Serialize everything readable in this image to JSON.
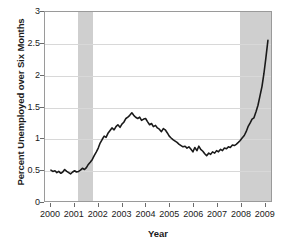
{
  "chart_data": {
    "type": "line",
    "title": "",
    "xlabel": "Year",
    "ylabel": "Percent Unemployed over Six Months",
    "xlim": [
      1999.75,
      2009.3
    ],
    "ylim": [
      0,
      3
    ],
    "grid": true,
    "legend": null,
    "line_color": "#1a1a1a",
    "shading_color": "#cfcfcf",
    "gridline_color": "#d8d8d8",
    "frame_color": "#9a9a9a",
    "yticks": [
      0,
      0.5,
      1,
      1.5,
      2,
      2.5,
      3
    ],
    "ytick_labels": [
      "0",
      "0.5",
      "1",
      "1.5",
      "2",
      "2.5",
      "3"
    ],
    "xticks": [
      2000,
      2001,
      2002,
      2003,
      2004,
      2005,
      2006,
      2007,
      2008,
      2009
    ],
    "xtick_labels": [
      "2000",
      "2001",
      "2002",
      "2003",
      "2004",
      "2005",
      "2006",
      "2007",
      "2008",
      "2009"
    ],
    "shaded_regions": [
      {
        "name": "recession-2001",
        "x0": 2001.15,
        "x1": 2001.75
      },
      {
        "name": "recession-2008",
        "x0": 2007.9,
        "x1": 2009.35
      }
    ],
    "series": [
      {
        "name": "Percent unemployed over six months",
        "x": [
          2000.0,
          2000.08,
          2000.17,
          2000.25,
          2000.33,
          2000.42,
          2000.5,
          2000.58,
          2000.67,
          2000.75,
          2000.83,
          2000.92,
          2001.0,
          2001.08,
          2001.17,
          2001.25,
          2001.33,
          2001.42,
          2001.5,
          2001.58,
          2001.67,
          2001.75,
          2001.83,
          2001.92,
          2002.0,
          2002.08,
          2002.17,
          2002.25,
          2002.33,
          2002.42,
          2002.5,
          2002.58,
          2002.67,
          2002.75,
          2002.83,
          2002.92,
          2003.0,
          2003.08,
          2003.17,
          2003.25,
          2003.33,
          2003.42,
          2003.5,
          2003.58,
          2003.67,
          2003.75,
          2003.83,
          2003.92,
          2004.0,
          2004.08,
          2004.17,
          2004.25,
          2004.33,
          2004.42,
          2004.5,
          2004.58,
          2004.67,
          2004.75,
          2004.83,
          2004.92,
          2005.0,
          2005.08,
          2005.17,
          2005.25,
          2005.33,
          2005.42,
          2005.5,
          2005.58,
          2005.67,
          2005.75,
          2005.83,
          2005.92,
          2006.0,
          2006.08,
          2006.17,
          2006.25,
          2006.33,
          2006.42,
          2006.5,
          2006.58,
          2006.67,
          2006.75,
          2006.83,
          2006.92,
          2007.0,
          2007.08,
          2007.17,
          2007.25,
          2007.33,
          2007.42,
          2007.5,
          2007.58,
          2007.67,
          2007.75,
          2007.83,
          2007.92,
          2008.0,
          2008.08,
          2008.17,
          2008.25,
          2008.33,
          2008.42,
          2008.5,
          2008.58,
          2008.67,
          2008.75,
          2008.83,
          2008.92,
          2009.0,
          2009.08,
          2009.17
        ],
        "y": [
          0.49,
          0.47,
          0.48,
          0.45,
          0.47,
          0.44,
          0.46,
          0.5,
          0.47,
          0.45,
          0.43,
          0.46,
          0.48,
          0.46,
          0.47,
          0.49,
          0.52,
          0.5,
          0.53,
          0.58,
          0.62,
          0.66,
          0.72,
          0.78,
          0.84,
          0.92,
          0.98,
          1.03,
          1.01,
          1.08,
          1.12,
          1.16,
          1.13,
          1.18,
          1.21,
          1.17,
          1.22,
          1.25,
          1.31,
          1.33,
          1.36,
          1.4,
          1.36,
          1.33,
          1.31,
          1.33,
          1.28,
          1.3,
          1.31,
          1.26,
          1.21,
          1.23,
          1.18,
          1.2,
          1.16,
          1.14,
          1.1,
          1.15,
          1.13,
          1.08,
          1.03,
          1.0,
          0.97,
          0.95,
          0.93,
          0.9,
          0.88,
          0.86,
          0.87,
          0.84,
          0.86,
          0.82,
          0.78,
          0.85,
          0.8,
          0.87,
          0.82,
          0.79,
          0.75,
          0.72,
          0.76,
          0.74,
          0.78,
          0.76,
          0.8,
          0.78,
          0.82,
          0.8,
          0.84,
          0.83,
          0.86,
          0.85,
          0.89,
          0.88,
          0.9,
          0.93,
          0.96,
          1.0,
          1.04,
          1.1,
          1.18,
          1.24,
          1.3,
          1.32,
          1.42,
          1.52,
          1.66,
          1.82,
          2.02,
          2.26,
          2.55
        ]
      }
    ]
  }
}
